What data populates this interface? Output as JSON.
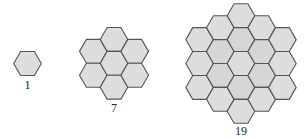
{
  "figure": {
    "colors": {
      "fill": "#dddddd",
      "fill_inner": "#d6d6d6",
      "stroke": "#555555",
      "background": "#ffffff"
    },
    "hex_radius": 13.8,
    "groups": [
      {
        "label": "1",
        "rings": 0,
        "center": [
          27.5,
          63.5
        ],
        "label_pos": [
          27.5,
          89
        ]
      },
      {
        "label": "7",
        "rings": 1,
        "center": [
          114,
          63.3
        ],
        "label_pos": [
          114,
          112
        ]
      },
      {
        "label": "19",
        "rings": 2,
        "center": [
          241,
          63.5
        ],
        "label_pos": [
          241,
          135
        ]
      }
    ]
  }
}
